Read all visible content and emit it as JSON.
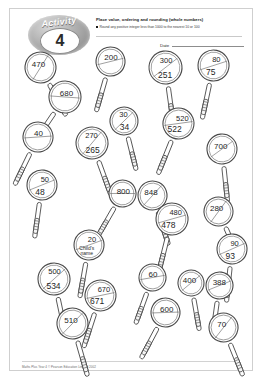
{
  "page": {
    "activity_word": "Activity",
    "activity_number": "4",
    "title": "Place value, ordering and rounding (whole numbers)",
    "objective": "Round any positive integer less than 1000 to the nearest 10 or 100",
    "date_label": "Date",
    "footer": "Maths Plus Year 4 © Pearson Education Limited 2002"
  },
  "magnifiers": [
    {
      "name": "magnifier-470",
      "top": "470",
      "bottom": "",
      "x": 30,
      "y": 58,
      "w": 56,
      "h": 46,
      "rot": -28,
      "lens": 31
    },
    {
      "name": "magnifier-200",
      "top": "200",
      "bottom": "",
      "x": 100,
      "y": 52,
      "w": 52,
      "h": 44,
      "rot": 16,
      "lens": 29
    },
    {
      "name": "magnifier-300",
      "top": "300",
      "bottom": "251",
      "x": 155,
      "y": 58,
      "w": 54,
      "h": 46,
      "rot": -8,
      "lens": 33
    },
    {
      "name": "magnifier-80",
      "top": "80",
      "bottom": "75",
      "x": 203,
      "y": 56,
      "w": 52,
      "h": 44,
      "rot": 12,
      "lens": 31
    },
    {
      "name": "magnifier-680",
      "top": "680",
      "bottom": "",
      "x": 55,
      "y": 88,
      "w": 58,
      "h": 48,
      "rot": 34,
      "lens": 32
    },
    {
      "name": "magnifier-30",
      "top": "30",
      "bottom": "34",
      "x": 114,
      "y": 112,
      "w": 48,
      "h": 42,
      "rot": -14,
      "lens": 28
    },
    {
      "name": "magnifier-520",
      "top": "520",
      "bottom": "522",
      "x": 168,
      "y": 114,
      "w": 52,
      "h": 46,
      "rot": 22,
      "lens": 31
    },
    {
      "name": "magnifier-40",
      "top": "40",
      "bottom": "",
      "x": 28,
      "y": 128,
      "w": 54,
      "h": 46,
      "rot": 26,
      "lens": 30
    },
    {
      "name": "magnifier-270",
      "top": "270",
      "bottom": "265",
      "x": 82,
      "y": 134,
      "w": 54,
      "h": 48,
      "rot": -20,
      "lens": 32
    },
    {
      "name": "magnifier-700",
      "top": "700",
      "bottom": "",
      "x": 212,
      "y": 140,
      "w": 52,
      "h": 44,
      "rot": -6,
      "lens": 30
    },
    {
      "name": "magnifier-50",
      "top": "50",
      "bottom": "48",
      "x": 32,
      "y": 176,
      "w": 50,
      "h": 46,
      "rot": 8,
      "lens": 30
    },
    {
      "name": "magnifier-800",
      "top": "800",
      "bottom": "",
      "x": 112,
      "y": 184,
      "w": 48,
      "h": 42,
      "rot": 30,
      "lens": 27
    },
    {
      "name": "magnifier-848",
      "top": "848",
      "bottom": "",
      "x": 142,
      "y": 186,
      "w": 50,
      "h": 44,
      "rot": -18,
      "lens": 29
    },
    {
      "name": "magnifier-480",
      "top": "480",
      "bottom": "478",
      "x": 162,
      "y": 210,
      "w": 54,
      "h": 48,
      "rot": 14,
      "lens": 32
    },
    {
      "name": "magnifier-280",
      "top": "280",
      "bottom": "",
      "x": 208,
      "y": 202,
      "w": 50,
      "h": 44,
      "rot": -24,
      "lens": 29
    },
    {
      "name": "magnifier-child",
      "top": "20",
      "bottom": "Child's name",
      "x": 79,
      "y": 236,
      "w": 50,
      "h": 46,
      "rot": 10,
      "lens": 30
    },
    {
      "name": "magnifier-90",
      "top": "90",
      "bottom": "93",
      "x": 222,
      "y": 240,
      "w": 50,
      "h": 44,
      "rot": 6,
      "lens": 30
    },
    {
      "name": "magnifier-500",
      "top": "500",
      "bottom": "534",
      "x": 44,
      "y": 270,
      "w": 54,
      "h": 48,
      "rot": -12,
      "lens": 32
    },
    {
      "name": "magnifier-60",
      "top": "60",
      "bottom": "",
      "x": 142,
      "y": 268,
      "w": 48,
      "h": 42,
      "rot": 20,
      "lens": 27
    },
    {
      "name": "magnifier-400",
      "top": "400",
      "bottom": "",
      "x": 181,
      "y": 274,
      "w": 46,
      "h": 40,
      "rot": -10,
      "lens": 26
    },
    {
      "name": "magnifier-388",
      "top": "388",
      "bottom": "",
      "x": 209,
      "y": 276,
      "w": 48,
      "h": 42,
      "rot": 8,
      "lens": 27
    },
    {
      "name": "magnifier-670",
      "top": "670",
      "bottom": "671",
      "x": 90,
      "y": 286,
      "w": 52,
      "h": 48,
      "rot": 18,
      "lens": 31
    },
    {
      "name": "magnifier-600",
      "top": "600",
      "bottom": "",
      "x": 155,
      "y": 303,
      "w": 50,
      "h": 44,
      "rot": 28,
      "lens": 29
    },
    {
      "name": "magnifier-510",
      "top": "510",
      "bottom": "",
      "x": 62,
      "y": 314,
      "w": 54,
      "h": 46,
      "rot": -16,
      "lens": 31
    },
    {
      "name": "magnifier-70",
      "top": "70",
      "bottom": "",
      "x": 213,
      "y": 318,
      "w": 50,
      "h": 44,
      "rot": -22,
      "lens": 29
    }
  ]
}
